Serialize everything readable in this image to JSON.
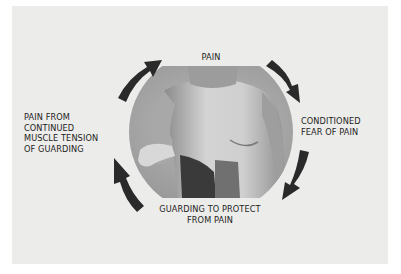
{
  "diagram": {
    "type": "cycle",
    "nodes": [
      {
        "id": "top",
        "lines": [
          "PAIN"
        ]
      },
      {
        "id": "right",
        "lines": [
          "CONDITIONED",
          "FEAR OF PAIN"
        ]
      },
      {
        "id": "bottom",
        "lines": [
          "GUARDING TO PROTECT",
          "FROM PAIN"
        ]
      },
      {
        "id": "left",
        "lines": [
          "PAIN FROM",
          "CONTINUED",
          "MUSCLE TENSION",
          "OF GUARDING"
        ]
      }
    ],
    "arrows": [
      "top-to-right",
      "right-to-bottom",
      "bottom-to-left",
      "left-to-top"
    ],
    "center_image": "photo of shirtless man guarding abdomen",
    "colors": {
      "panel": "#ececea",
      "arrow": "#2a2a2a",
      "text": "#1e1e1e"
    }
  }
}
